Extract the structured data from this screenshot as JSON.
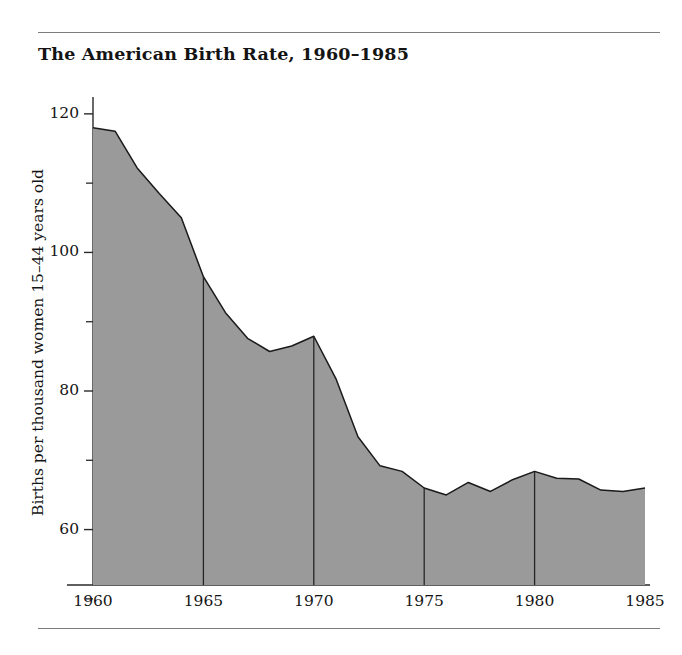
{
  "figure": {
    "title": "The American Birth Rate, 1960–1985",
    "has_top_rule": true,
    "has_bottom_rule": true,
    "background_color": "#ffffff",
    "rule_color": "#7c7c7c"
  },
  "chart_data": {
    "type": "area",
    "title": "The American Birth Rate, 1960–1985",
    "subtitle": "",
    "xlabel": "",
    "ylabel": "Births per thousand women 15–44 years old",
    "fill_color": "#9a9a9a",
    "line_color": "#1a1a1a",
    "grid": false,
    "vertical_rules_at": [
      1965,
      1970,
      1975,
      1980
    ],
    "legend": null,
    "xlim": [
      1960,
      1985
    ],
    "ylim": [
      52,
      122
    ],
    "x_major_ticks": [
      1960,
      1965,
      1970,
      1975,
      1980,
      1985
    ],
    "x_tick_labels": [
      "1960",
      "1965",
      "1970",
      "1975",
      "1980",
      "1985"
    ],
    "y_major_ticks": [
      60,
      80,
      100,
      120
    ],
    "y_tick_labels": [
      "60",
      "80",
      "100",
      "120"
    ],
    "y_minor_ticks": [
      50,
      70,
      90,
      110
    ],
    "x": [
      1960,
      1961,
      1962,
      1963,
      1964,
      1965,
      1966,
      1967,
      1968,
      1969,
      1970,
      1971,
      1972,
      1973,
      1974,
      1975,
      1976,
      1977,
      1978,
      1979,
      1980,
      1981,
      1982,
      1983,
      1984,
      1985
    ],
    "values": [
      118,
      117.5,
      112.2,
      108.5,
      105.0,
      96.5,
      91.3,
      87.6,
      85.7,
      86.5,
      87.9,
      81.8,
      73.4,
      69.2,
      68.4,
      66.0,
      65.0,
      66.8,
      65.5,
      67.2,
      68.4,
      67.4,
      67.3,
      65.7,
      65.5,
      66.0
    ]
  }
}
